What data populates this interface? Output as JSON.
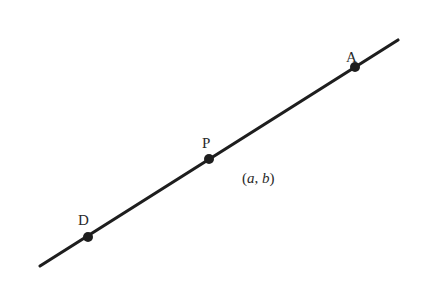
{
  "diagram": {
    "line": {
      "x1": 40,
      "y1": 266,
      "x2": 398,
      "y2": 40,
      "color": "#1e1e1e",
      "width": 3.2
    },
    "points": [
      {
        "id": "A",
        "label": "A",
        "cx": 355,
        "cy": 67,
        "label_x": 346,
        "label_y": 55
      },
      {
        "id": "P",
        "label": "P",
        "cx": 209,
        "cy": 159,
        "label_x": 203,
        "label_y": 146
      },
      {
        "id": "D",
        "label": "D",
        "cx": 88,
        "cy": 237,
        "label_x": 79,
        "label_y": 223
      }
    ],
    "coordinate_label": {
      "open": "(",
      "a": "a",
      "sep": ", ",
      "b": "b",
      "close": ")",
      "x": 240,
      "y": 183
    },
    "point_color": "#1e1e1e"
  }
}
